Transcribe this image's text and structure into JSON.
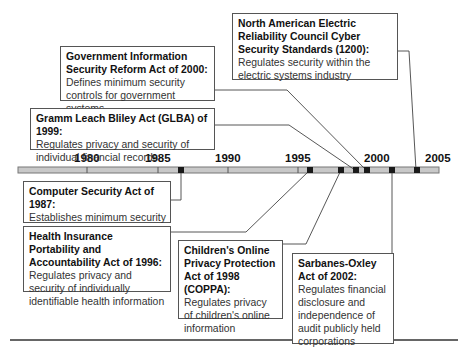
{
  "timeline": {
    "years": [
      {
        "label": "1980",
        "x": 87
      },
      {
        "label": "1985",
        "x": 158
      },
      {
        "label": "1990",
        "x": 228
      },
      {
        "label": "1995",
        "x": 298
      },
      {
        "label": "2000",
        "x": 367
      },
      {
        "label": "2005",
        "x": 437
      }
    ]
  },
  "events": [
    {
      "id": "nerc",
      "year": 2003,
      "title": "North American Electric Reliability Council Cyber Security Standards (1200):",
      "description": "Regulates security within the electric systems industry"
    },
    {
      "id": "gisra",
      "year": 2000,
      "title": "Government Information Security Reform Act of 2000:",
      "description": "Defines minimum security controls for government systems"
    },
    {
      "id": "glba",
      "year": 1999,
      "title": "Gramm Leach Bliley Act (GLBA) of 1999:",
      "description": "Regulates privacy and security of individual financial records"
    },
    {
      "id": "csa",
      "year": 1987,
      "title": "Computer Security Act of 1987:",
      "description": "Establishes minimum security standards for Federal Agencies"
    },
    {
      "id": "hipaa",
      "year": 1996,
      "title": "Health Insurance Portability and Accountability Act of 1996:",
      "description": "Regulates privacy and security of individually identifiable health information"
    },
    {
      "id": "coppa",
      "year": 1998,
      "title": "Children's Online Privacy Protection Act of 1998 (COPPA):",
      "description": "Regulates privacy of children's online information"
    },
    {
      "id": "sox",
      "year": 2002,
      "title": "Sarbanes-Oxley Act of 2002:",
      "description": "Regulates financial disclosure and independence of audit publicly held corporations"
    }
  ],
  "colors": {
    "bar": "#c8c8c8",
    "bar_border": "#666666",
    "marker": "#1a1a1a",
    "line": "#444444"
  }
}
